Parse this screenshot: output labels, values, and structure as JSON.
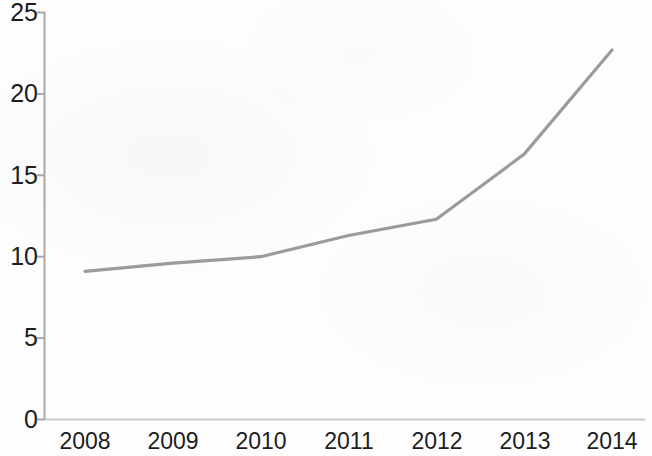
{
  "chart_data": {
    "type": "line",
    "title": "",
    "subtitle": "",
    "xlabel": "",
    "ylabel": "",
    "categories": [
      "2008",
      "2009",
      "2010",
      "2011",
      "2012",
      "2013",
      "2014"
    ],
    "x": [
      2008,
      2009,
      2010,
      2011,
      2012,
      2013,
      2014
    ],
    "values": [
      9.1,
      9.6,
      10.0,
      11.3,
      12.3,
      16.3,
      22.7
    ],
    "series": [
      {
        "name": "",
        "values": [
          9.1,
          9.6,
          10.0,
          11.3,
          12.3,
          16.3,
          22.7
        ]
      }
    ],
    "ylim": [
      0,
      25
    ],
    "yticks": [
      0,
      5,
      10,
      15,
      20,
      25
    ],
    "ytick_labels": [
      "0",
      "5",
      "10",
      "15",
      "20",
      "25"
    ],
    "xtick_labels": [
      "2008",
      "2009",
      "2010",
      "2011",
      "2012",
      "2013",
      "2014"
    ],
    "grid": false,
    "legend": false,
    "legend_position": "none",
    "markers": false,
    "line_color": "#9b9b9b",
    "line_width": 3,
    "axis_color": "#a8a8a8",
    "tick_label_color": "#1d1d1d",
    "background_color": "#fdfdfd"
  },
  "axes": {
    "y_axis_name": "value-axis",
    "x_axis_name": "year-axis"
  }
}
